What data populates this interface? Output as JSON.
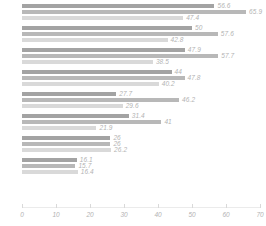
{
  "chart_data": {
    "type": "bar",
    "orientation": "horizontal",
    "title": "",
    "subtitle": "",
    "xlabel": "",
    "ylabel": "",
    "xlim": [
      0,
      70
    ],
    "ylim": null,
    "grid": false,
    "legend": null,
    "xticks": [
      "0",
      "10",
      "20",
      "30",
      "40",
      "50",
      "60",
      "70"
    ],
    "xtick_values": [
      0,
      10,
      20,
      30,
      40,
      50,
      60,
      70
    ],
    "categories": [
      "G1",
      "G2",
      "G3",
      "G4",
      "G5",
      "G6",
      "G7",
      "G8"
    ],
    "series": [
      {
        "name": "Series 1",
        "color": "#a3a3a3",
        "values": [
          56.6,
          50,
          47.9,
          44,
          27.7,
          31.4,
          26,
          16.1
        ]
      },
      {
        "name": "Series 2",
        "color": "#b8b8b8",
        "values": [
          65.9,
          57.6,
          57.7,
          47.8,
          46.2,
          41,
          26,
          15.7
        ]
      },
      {
        "name": "Series 3",
        "color": "#d9d9d9",
        "values": [
          47.4,
          42.8,
          38.5,
          40.2,
          29.6,
          21.9,
          26.2,
          16.4
        ]
      }
    ],
    "bars": [
      {
        "group": 0,
        "series": 0,
        "value": 56.6,
        "label": "56.6",
        "color": "#a3a3a3"
      },
      {
        "group": 0,
        "series": 1,
        "value": 65.9,
        "label": "65.9",
        "color": "#b8b8b8"
      },
      {
        "group": 0,
        "series": 2,
        "value": 47.4,
        "label": "47.4",
        "color": "#d9d9d9"
      },
      {
        "group": 1,
        "series": 0,
        "value": 50,
        "label": "50",
        "color": "#a3a3a3"
      },
      {
        "group": 1,
        "series": 1,
        "value": 57.6,
        "label": "57.6",
        "color": "#b8b8b8"
      },
      {
        "group": 1,
        "series": 2,
        "value": 42.8,
        "label": "42.8",
        "color": "#d9d9d9"
      },
      {
        "group": 2,
        "series": 0,
        "value": 47.9,
        "label": "47.9",
        "color": "#a3a3a3"
      },
      {
        "group": 2,
        "series": 1,
        "value": 57.7,
        "label": "57.7",
        "color": "#b8b8b8"
      },
      {
        "group": 2,
        "series": 2,
        "value": 38.5,
        "label": "38.5",
        "color": "#d9d9d9"
      },
      {
        "group": 3,
        "series": 0,
        "value": 44,
        "label": "44",
        "color": "#a3a3a3"
      },
      {
        "group": 3,
        "series": 1,
        "value": 47.8,
        "label": "47.8",
        "color": "#b8b8b8"
      },
      {
        "group": 3,
        "series": 2,
        "value": 40.2,
        "label": "40.2",
        "color": "#d9d9d9"
      },
      {
        "group": 4,
        "series": 0,
        "value": 27.7,
        "label": "27.7",
        "color": "#a3a3a3"
      },
      {
        "group": 4,
        "series": 1,
        "value": 46.2,
        "label": "46.2",
        "color": "#b8b8b8"
      },
      {
        "group": 4,
        "series": 2,
        "value": 29.6,
        "label": "29.6",
        "color": "#d9d9d9"
      },
      {
        "group": 5,
        "series": 0,
        "value": 31.4,
        "label": "31.4",
        "color": "#a3a3a3"
      },
      {
        "group": 5,
        "series": 1,
        "value": 41,
        "label": "41",
        "color": "#b8b8b8"
      },
      {
        "group": 5,
        "series": 2,
        "value": 21.9,
        "label": "21.9",
        "color": "#d9d9d9"
      },
      {
        "group": 6,
        "series": 0,
        "value": 26,
        "label": "26",
        "color": "#a3a3a3"
      },
      {
        "group": 6,
        "series": 1,
        "value": 26,
        "label": "26",
        "color": "#b8b8b8"
      },
      {
        "group": 6,
        "series": 2,
        "value": 26.2,
        "label": "26.2",
        "color": "#d9d9d9"
      },
      {
        "group": 7,
        "series": 0,
        "value": 16.1,
        "label": "16.1",
        "color": "#a3a3a3"
      },
      {
        "group": 7,
        "series": 1,
        "value": 15.7,
        "label": "15.7",
        "color": "#b8b8b8"
      },
      {
        "group": 7,
        "series": 2,
        "value": 16.4,
        "label": "16.4",
        "color": "#d9d9d9"
      }
    ]
  },
  "style": {
    "label_color": "#b3b3b3",
    "tick_color": "#b3b3b3",
    "axis_color": "#ebebeb",
    "background": "#ffffff"
  }
}
